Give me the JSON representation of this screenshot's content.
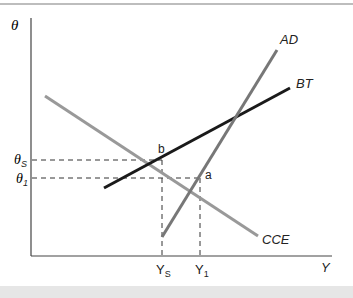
{
  "diagram": {
    "axes": {
      "y_label": "θ",
      "x_label": "Y"
    },
    "curves": [
      {
        "name": "AD",
        "label": "AD",
        "color": "#777777"
      },
      {
        "name": "BT",
        "label": "BT",
        "color": "#1a1a1a"
      },
      {
        "name": "CCE",
        "label": "CCE",
        "color": "#999999"
      }
    ],
    "points": [
      {
        "name": "b",
        "label": "b"
      },
      {
        "name": "a",
        "label": "a"
      }
    ],
    "y_ticks": [
      {
        "label": "θ",
        "sub": "S"
      },
      {
        "label": "θ",
        "sub": "1"
      }
    ],
    "x_ticks": [
      {
        "label": "Y",
        "sub": "S"
      },
      {
        "label": "Y",
        "sub": "1"
      }
    ]
  }
}
